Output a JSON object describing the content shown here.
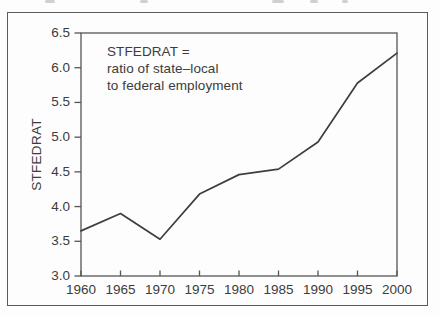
{
  "figure": {
    "background": "#fdfdfd",
    "border_color": "#5b5b5b"
  },
  "chart_data": {
    "type": "line",
    "title": "",
    "xlabel": "",
    "ylabel": "STFEDRAT",
    "annotation_lines": [
      "STFEDRAT =",
      "ratio of state–local",
      "to federal employment"
    ],
    "series_name": "STFEDRAT",
    "x": [
      1960,
      1965,
      1970,
      1975,
      1980,
      1985,
      1990,
      1995,
      2000
    ],
    "values": [
      3.65,
      3.9,
      3.53,
      4.18,
      4.46,
      4.54,
      4.93,
      5.78,
      6.21
    ],
    "xlim": [
      1960,
      2000
    ],
    "ylim": [
      3.0,
      6.5
    ],
    "ytick_values": [
      3.0,
      3.5,
      4.0,
      4.5,
      5.0,
      5.5,
      6.0,
      6.5
    ],
    "ytick_labels": [
      "3.0",
      "3.5",
      "4.0",
      "4.5",
      "5.0",
      "5.5",
      "6.0",
      "6.5"
    ],
    "xtick_values": [
      1960,
      1965,
      1970,
      1975,
      1980,
      1985,
      1990,
      1995,
      2000
    ],
    "xtick_labels": [
      "1960",
      "1965",
      "1970",
      "1975",
      "1980",
      "1985",
      "1990",
      "1995",
      "2000"
    ],
    "grid": false,
    "legend_position": "none",
    "line_color": "#3e3e3e",
    "axis_color": "#565656",
    "text_color": "#3c3c3c"
  }
}
